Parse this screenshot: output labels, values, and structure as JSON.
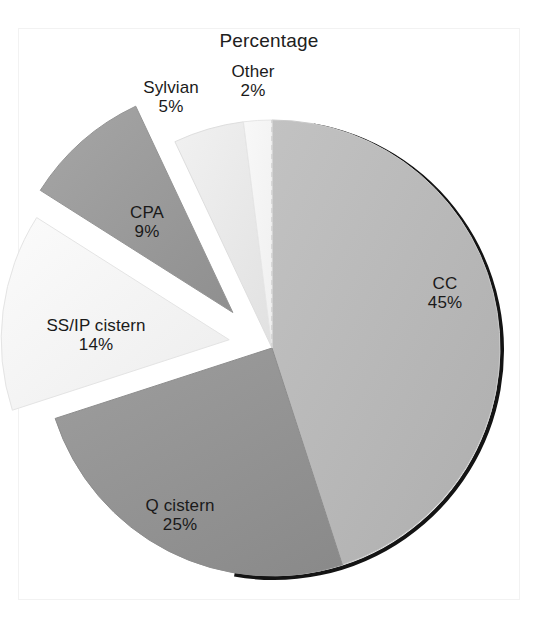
{
  "chart_data": {
    "type": "pie",
    "title": "Percentage",
    "xlabel": "",
    "ylabel": "",
    "legend": "none",
    "grid": false,
    "units": "percent",
    "categories": [
      "CC",
      "Q cistern",
      "SS/IP cistern",
      "CPA",
      "Sylvian",
      "Other"
    ],
    "values": [
      45,
      25,
      14,
      9,
      5,
      2
    ],
    "labels": [
      "45%",
      "25%",
      "14%",
      "9%",
      "5%",
      "2%"
    ],
    "slices": [
      {
        "name": "CC",
        "value": 45,
        "label": "CC",
        "percent_text": "45%",
        "color": "#b5b5b5",
        "exploded": false,
        "start_angle_deg": 0,
        "end_angle_deg": 162
      },
      {
        "name": "Q cistern",
        "value": 25,
        "label": "Q cistern",
        "percent_text": "25%",
        "color": "#939393",
        "exploded": false,
        "start_angle_deg": 162,
        "end_angle_deg": 252
      },
      {
        "name": "SS/IP cistern",
        "value": 14,
        "label": "SS/IP cistern",
        "percent_text": "14%",
        "color": "#f3f3f3",
        "exploded": true,
        "start_angle_deg": 252,
        "end_angle_deg": 302.4
      },
      {
        "name": "CPA",
        "value": 9,
        "label": "CPA",
        "percent_text": "9%",
        "color": "#9b9b9b",
        "exploded": true,
        "start_angle_deg": 302.4,
        "end_angle_deg": 334.8
      },
      {
        "name": "Sylvian",
        "value": 5,
        "label": "Sylvian",
        "percent_text": "5%",
        "color": "#e9e9e9",
        "exploded": false,
        "start_angle_deg": 334.8,
        "end_angle_deg": 352.8
      },
      {
        "name": "Other",
        "value": 2,
        "label": "Other",
        "percent_text": "2%",
        "color": "#f5f5f5",
        "exploded": false,
        "start_angle_deg": 352.8,
        "end_angle_deg": 360
      }
    ],
    "colors": {
      "cc": "#b5b5b5",
      "q_cistern": "#939393",
      "ss_ip_cistern": "#f3f3f3",
      "cpa": "#9b9b9b",
      "sylvian": "#e9e9e9",
      "other": "#f5f5f5",
      "rim_shadow": "#111111",
      "text": "#1a1a1a",
      "background": "#ffffff"
    }
  }
}
